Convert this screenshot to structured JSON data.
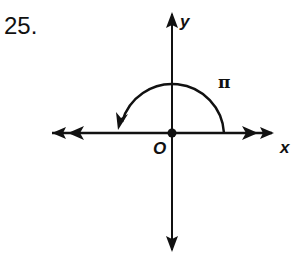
{
  "problem": {
    "number": "25."
  },
  "diagram": {
    "x_axis_label": "x",
    "y_axis_label": "y",
    "origin_label": "O",
    "angle_label": "π",
    "angle_radians": 3.14159,
    "rotation": "counterclockwise",
    "initial_side": "positive x-axis",
    "terminal_side": "negative x-axis",
    "colors": {
      "stroke": "#111111",
      "background": "#ffffff"
    }
  }
}
